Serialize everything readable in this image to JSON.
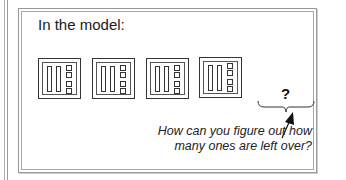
{
  "panel": {
    "title": "In the model:"
  },
  "model": {
    "blocks": [
      {
        "tens_rods": 2,
        "ones_squares": 4
      },
      {
        "tens_rods": 2,
        "ones_squares": 4
      },
      {
        "tens_rods": 2,
        "ones_squares": 4
      },
      {
        "tens_rods": 2,
        "ones_squares": 4
      }
    ],
    "unknown_label": "?"
  },
  "annotation": {
    "line1": "How can you figure out how",
    "line2": "many ones are left over?"
  },
  "colors": {
    "frame": "#9a9a9a",
    "ink": "#1a1a1a"
  }
}
